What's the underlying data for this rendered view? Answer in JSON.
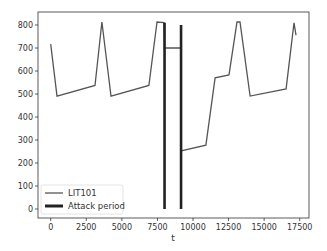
{
  "chart_data": {
    "type": "line",
    "title": "",
    "xlabel": "t",
    "ylabel": "",
    "xlim": [
      -700,
      17800
    ],
    "ylim": [
      -40,
      860
    ],
    "xticks": [
      0,
      2500,
      5000,
      7500,
      10000,
      12500,
      15000,
      17500
    ],
    "yticks": [
      0,
      100,
      200,
      300,
      400,
      500,
      600,
      700,
      800
    ],
    "grid": false,
    "legend_position": "lower left",
    "series": [
      {
        "name": "LIT101",
        "color": "#555555",
        "points": [
          [
            0,
            717
          ],
          [
            440,
            491
          ],
          [
            3110,
            537
          ],
          [
            3600,
            813
          ],
          [
            4240,
            491
          ],
          [
            6900,
            537
          ],
          [
            7470,
            813
          ],
          [
            7960,
            810
          ],
          [
            8000,
            700
          ],
          [
            9160,
            700
          ],
          [
            9160,
            252
          ],
          [
            10910,
            278
          ],
          [
            11550,
            570
          ],
          [
            12530,
            583
          ],
          [
            13090,
            813
          ],
          [
            13300,
            813
          ],
          [
            14010,
            491
          ],
          [
            16540,
            522
          ],
          [
            17100,
            809
          ],
          [
            17240,
            756
          ]
        ]
      }
    ],
    "attack_period": {
      "name": "Attack period",
      "color": "#222222",
      "lines": [
        {
          "x": 8000,
          "y0": 0,
          "y1": 810
        },
        {
          "x": 9160,
          "y0": 0,
          "y1": 800
        }
      ]
    },
    "legend": [
      "LIT101",
      "Attack period"
    ]
  }
}
